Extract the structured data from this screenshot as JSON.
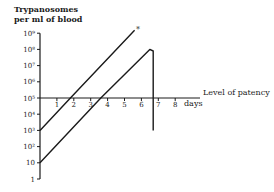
{
  "chart_data": {
    "type": "line",
    "title": "",
    "ylabel": [
      "Trypanosomes",
      "per ml of blood"
    ],
    "xlabel": "days",
    "yscale": "log",
    "ylim": [
      1,
      1000000000
    ],
    "xlim": [
      0,
      8
    ],
    "y_ticks": [
      "1",
      "10",
      "10²",
      "10³",
      "10⁴",
      "10⁵",
      "10⁶",
      "10⁷",
      "10⁸",
      "10⁹"
    ],
    "x_ticks": [
      "1",
      "2",
      "3",
      "4",
      "5",
      "6",
      "7",
      "8"
    ],
    "reference_line": {
      "y": 100000,
      "label": "Level of patency"
    },
    "series": [
      {
        "name": "Inoculum 10³",
        "x": [
          0,
          1.8,
          5.6
        ],
        "y": [
          1000,
          100000,
          1500000000
        ],
        "annotation": "*"
      },
      {
        "name": "Inoculum 10",
        "x": [
          0,
          3.6,
          6.5,
          6.7,
          6.7
        ],
        "y": [
          10,
          100000,
          100000000,
          80000000,
          1000
        ]
      }
    ],
    "grid": false,
    "legend": null
  },
  "labels": {
    "y_title_1": "Trypanosomes",
    "y_title_2": "per ml of blood",
    "patency": "Level of patency",
    "days": "days",
    "asterisk": "*"
  }
}
